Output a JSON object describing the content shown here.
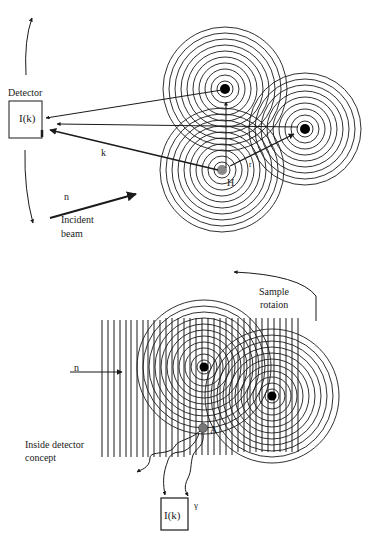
{
  "top_panel": {
    "detector_label": "Detector",
    "detector_box_label": "I(k)",
    "k_label": "k",
    "n_label": "n",
    "incident_label_line1": "Incident",
    "incident_label_line2": "beam",
    "H_label": "H",
    "r_label": "r",
    "atoms": [
      {
        "name": "host",
        "x": 222,
        "y": 170,
        "fill": "#888888"
      },
      {
        "name": "neighbor-top",
        "x": 225,
        "y": 89,
        "fill": "#000000"
      },
      {
        "name": "neighbor-right",
        "x": 305,
        "y": 129,
        "fill": "#000000"
      }
    ]
  },
  "bottom_panel": {
    "sample_rotation_line1": "Sample",
    "sample_rotation_line2": "rotaion",
    "n_label": "n",
    "inside_label_line1": "Inside detector",
    "inside_label_line2": "concept",
    "A_label": "A",
    "gamma_label": "γ",
    "detector_box_label": "I(k)",
    "atoms": [
      {
        "name": "scatterer-1",
        "x": 204,
        "y": 367,
        "fill": "#000000"
      },
      {
        "name": "scatterer-2",
        "x": 272,
        "y": 396,
        "fill": "#000000"
      },
      {
        "name": "emitter-A",
        "x": 203,
        "y": 428,
        "fill": "#777777"
      }
    ]
  },
  "colors": {
    "line": "#1a1a1a",
    "background": "#ffffff"
  }
}
